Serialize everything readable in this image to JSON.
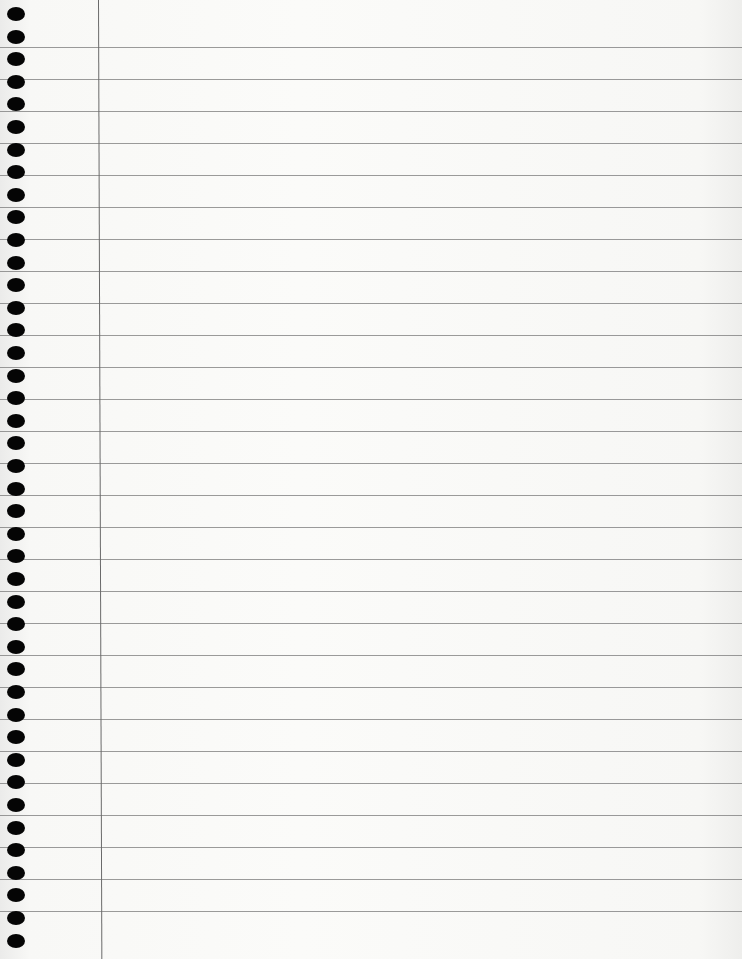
{
  "page": {
    "type": "ruled-notebook-paper",
    "background_color": "#f7f7f5",
    "rule_color": "#7a7a7a",
    "margin_line_color": "#6a6a6a",
    "hole_color": "#050505",
    "rule_count": 28,
    "rule_first_y": 47,
    "rule_spacing": 32,
    "hole_count": 42,
    "hole_first_y": 7,
    "hole_spacing": 22.6,
    "margin_x": 98
  }
}
